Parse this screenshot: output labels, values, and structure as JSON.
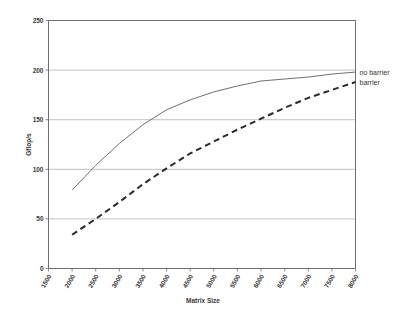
{
  "chart_data": {
    "type": "line",
    "title": "",
    "xlabel": "Matrix Size",
    "ylabel": "Gflop/s",
    "xlim": [
      1500,
      8000
    ],
    "ylim": [
      0,
      250
    ],
    "grid": true,
    "legend_position": "right",
    "xticks": [
      1500,
      2000,
      2500,
      3000,
      3500,
      4000,
      4500,
      5000,
      5500,
      6000,
      6500,
      7000,
      7500,
      8000
    ],
    "xtick_labels": [
      "1500",
      "2000",
      "2500",
      "3000",
      "3500",
      "4000",
      "4500",
      "5000",
      "5500",
      "6000",
      "6500",
      "7000",
      "7500",
      "8000"
    ],
    "yticks": [
      0,
      50,
      100,
      150,
      200,
      250
    ],
    "ytick_labels": [
      "0",
      "50",
      "100",
      "150",
      "200",
      "250"
    ],
    "x": [
      2000,
      2500,
      3000,
      3500,
      4000,
      4500,
      5000,
      5500,
      6000,
      6500,
      7000,
      7500,
      8000
    ],
    "series": [
      {
        "name": "no barrier",
        "style": "solid",
        "color": "#707070",
        "values": [
          79,
          104,
          126,
          145,
          160,
          170,
          178,
          184,
          189,
          191,
          193,
          196,
          198
        ]
      },
      {
        "name": "barrier",
        "style": "dashed",
        "color": "#2b2b2b",
        "values": [
          34,
          50,
          67,
          85,
          101,
          116,
          128,
          140,
          151,
          162,
          172,
          180,
          188
        ]
      }
    ],
    "annotations": [
      {
        "text": "no barrier",
        "x": 8000,
        "y": 198
      },
      {
        "text": "barrier",
        "x": 8000,
        "y": 188
      }
    ]
  },
  "legend": {
    "items": [
      {
        "label": "no barrier"
      },
      {
        "label": "barrier"
      }
    ]
  },
  "axes": {
    "y_title": "Gflop/s",
    "x_title": "Matrix Size"
  }
}
